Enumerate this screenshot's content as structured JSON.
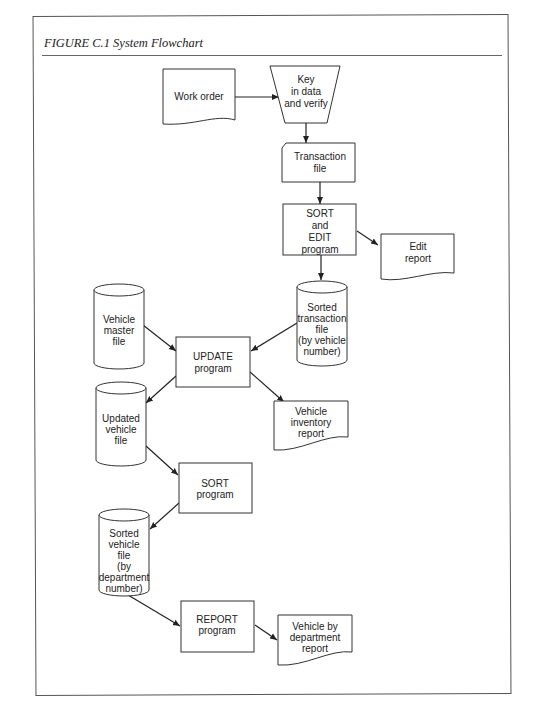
{
  "figure": {
    "label": "FIGURE C.1",
    "title": "System Flowchart",
    "full_title": "FIGURE C.1   System Flowchart"
  },
  "nodes": [
    {
      "id": "work_order",
      "type": "document",
      "lines": [
        "Work order"
      ]
    },
    {
      "id": "key_in",
      "type": "manual-operation",
      "lines": [
        "Key",
        "in data",
        "and verify"
      ]
    },
    {
      "id": "transaction_file",
      "type": "card",
      "lines": [
        "Transaction",
        "file"
      ]
    },
    {
      "id": "sort_edit",
      "type": "process",
      "lines": [
        "SORT",
        "and",
        "EDIT",
        "program"
      ]
    },
    {
      "id": "edit_report",
      "type": "document",
      "lines": [
        "Edit",
        "report"
      ]
    },
    {
      "id": "sorted_transaction",
      "type": "disk",
      "lines": [
        "Sorted",
        "transaction",
        "file",
        "(by vehicle",
        "number)"
      ]
    },
    {
      "id": "vehicle_master",
      "type": "disk",
      "lines": [
        "Vehicle",
        "master",
        "file"
      ]
    },
    {
      "id": "update",
      "type": "process",
      "lines": [
        "UPDATE",
        "program"
      ]
    },
    {
      "id": "updated_vehicle",
      "type": "disk",
      "lines": [
        "Updated",
        "vehicle",
        "file"
      ]
    },
    {
      "id": "inventory_report",
      "type": "document",
      "lines": [
        "Vehicle",
        "inventory",
        "report"
      ]
    },
    {
      "id": "sort",
      "type": "process",
      "lines": [
        "SORT",
        "program"
      ]
    },
    {
      "id": "sorted_vehicle",
      "type": "disk",
      "lines": [
        "Sorted",
        "vehicle",
        "file",
        "(by",
        "department",
        "number)"
      ]
    },
    {
      "id": "report",
      "type": "process",
      "lines": [
        "REPORT",
        "program"
      ]
    },
    {
      "id": "dept_report",
      "type": "document",
      "lines": [
        "Vehicle by",
        "department",
        "report"
      ]
    }
  ],
  "edges": [
    {
      "from": "work_order",
      "to": "key_in"
    },
    {
      "from": "key_in",
      "to": "transaction_file"
    },
    {
      "from": "transaction_file",
      "to": "sort_edit"
    },
    {
      "from": "sort_edit",
      "to": "edit_report"
    },
    {
      "from": "sort_edit",
      "to": "sorted_transaction"
    },
    {
      "from": "vehicle_master",
      "to": "update"
    },
    {
      "from": "sorted_transaction",
      "to": "update"
    },
    {
      "from": "update",
      "to": "updated_vehicle"
    },
    {
      "from": "update",
      "to": "inventory_report"
    },
    {
      "from": "updated_vehicle",
      "to": "sort"
    },
    {
      "from": "sort",
      "to": "sorted_vehicle"
    },
    {
      "from": "sorted_vehicle",
      "to": "report"
    },
    {
      "from": "report",
      "to": "dept_report"
    }
  ]
}
